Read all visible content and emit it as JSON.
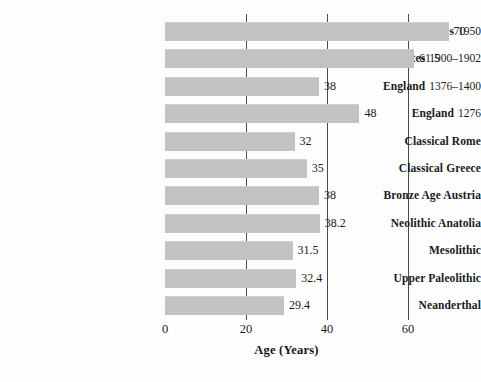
{
  "chart_data": {
    "type": "bar",
    "orientation": "horizontal",
    "title": "",
    "xlabel": "Age (Years)",
    "ylabel": "",
    "xlim": [
      0,
      72
    ],
    "xticks": [
      0,
      20,
      40,
      60
    ],
    "xtick_labels": [
      "0",
      "20",
      "40",
      "60"
    ],
    "grid": "vertical-only",
    "legend": "none",
    "categories": [
      "United States 1950",
      "United States 1900–1902",
      "England 1376–1400",
      "England 1276",
      "Classical Rome",
      "Classical Greece",
      "Bronze Age Austria",
      "Neolithic Anatolia",
      "Mesolithic",
      "Upper Paleolithic",
      "Neanderthal"
    ],
    "values": [
      70,
      61.5,
      38,
      48,
      32,
      35,
      38,
      38.2,
      31.5,
      32.4,
      29.4
    ],
    "value_labels": [
      "70",
      "61.5",
      "38",
      "48",
      "32",
      "35",
      "38",
      "38.2",
      "31.5",
      "32.4",
      "29.4"
    ],
    "bar_color": "#c2c2c2",
    "gridline_color": "#4a4a4a",
    "text_color": "#1b1b1b"
  },
  "rows": [
    {
      "place": "United States",
      "period": "1950",
      "value": 70,
      "value_label": "70"
    },
    {
      "place": "United States",
      "period": "1900–1902",
      "value": 61.5,
      "value_label": "61.5"
    },
    {
      "place": "England",
      "period": "1376–1400",
      "value": 38,
      "value_label": "38"
    },
    {
      "place": "England",
      "period": "1276",
      "value": 48,
      "value_label": "48"
    },
    {
      "place": "Classical Rome",
      "period": "",
      "value": 32,
      "value_label": "32"
    },
    {
      "place": "Classical Greece",
      "period": "",
      "value": 35,
      "value_label": "35"
    },
    {
      "place": "Bronze Age Austria",
      "period": "",
      "value": 38,
      "value_label": "38"
    },
    {
      "place": "Neolithic Anatolia",
      "period": "",
      "value": 38.2,
      "value_label": "38.2"
    },
    {
      "place": "Mesolithic",
      "period": "",
      "value": 31.5,
      "value_label": "31.5"
    },
    {
      "place": "Upper Paleolithic",
      "period": "",
      "value": 32.4,
      "value_label": "32.4"
    },
    {
      "place": "Neanderthal",
      "period": "",
      "value": 29.4,
      "value_label": "29.4"
    }
  ],
  "axis": {
    "title": "Age (Years)",
    "ticks": [
      "0",
      "20",
      "40",
      "60"
    ]
  }
}
